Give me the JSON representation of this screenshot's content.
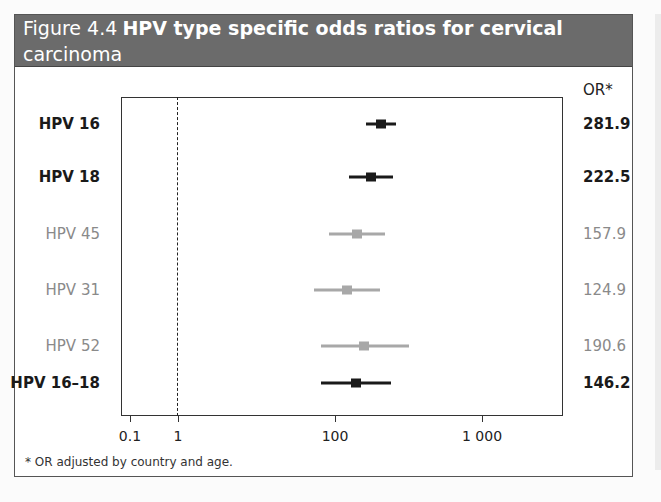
{
  "figure": {
    "label": "Figure 4.4",
    "title_line1": "HPV type specific odds ratios for cervical",
    "title_line2": "carcinoma",
    "or_header": "OR*",
    "footnote": "* OR adjusted by country and age."
  },
  "colors": {
    "header_bg": "#6b6b6b",
    "header_text": "#ffffff",
    "highlight": "#1a1a1a",
    "muted": "#a8a8a8"
  },
  "axis": {
    "scale": "log",
    "ticks": [
      {
        "label": "0.1",
        "x": 130
      },
      {
        "label": "1",
        "x": 178
      },
      {
        "label": "100",
        "x": 335
      },
      {
        "label": "1 000",
        "x": 482
      }
    ],
    "reference_line_value": 1
  },
  "rows": [
    {
      "label": "HPV 16",
      "value": "281.9",
      "style": "bold",
      "y": 124,
      "ci_x": [
        366,
        396
      ],
      "pt_x": 381
    },
    {
      "label": "HPV 18",
      "value": "222.5",
      "style": "bold",
      "y": 177,
      "ci_x": [
        349,
        393
      ],
      "pt_x": 371
    },
    {
      "label": "HPV 45",
      "value": "157.9",
      "style": "light",
      "y": 234,
      "ci_x": [
        329,
        385
      ],
      "pt_x": 357
    },
    {
      "label": "HPV 31",
      "value": "124.9",
      "style": "light",
      "y": 290,
      "ci_x": [
        314,
        380
      ],
      "pt_x": 347
    },
    {
      "label": "HPV 52",
      "value": "190.6",
      "style": "light",
      "y": 346,
      "ci_x": [
        321,
        409
      ],
      "pt_x": 364
    },
    {
      "label": "HPV 16–18",
      "value": "146.2",
      "style": "bold",
      "y": 383,
      "ci_x": [
        321,
        391
      ],
      "pt_x": 356
    }
  ],
  "chart_data": {
    "type": "forest",
    "title": "Figure 4.4 HPV type specific odds ratios for cervical carcinoma",
    "xlabel": "",
    "ylabel": "",
    "x_scale": "log",
    "x_ticks": [
      "0.1",
      "1",
      "100",
      "1 000"
    ],
    "reference_line": 1,
    "right_column_header": "OR*",
    "categories": [
      "HPV 16",
      "HPV 18",
      "HPV 45",
      "HPV 31",
      "HPV 52",
      "HPV 16–18"
    ],
    "values": [
      281.9,
      222.5,
      157.9,
      124.9,
      190.6,
      146.2
    ],
    "ci_low_est": [
      160,
      120,
      85,
      65,
      75,
      75
    ],
    "ci_high_est": [
      400,
      380,
      300,
      280,
      500,
      350
    ],
    "emphasized": [
      "HPV 16",
      "HPV 18",
      "HPV 16–18"
    ],
    "footnote": "* OR adjusted by country and age."
  }
}
